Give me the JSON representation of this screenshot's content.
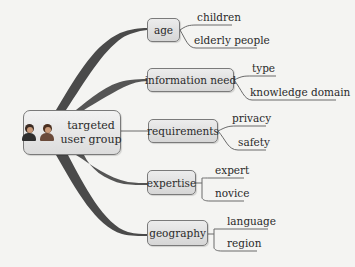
{
  "diagram": {
    "type": "mind-map",
    "center": {
      "label_line1": "targeted",
      "label_line2": "user group",
      "icon": "people-icon",
      "box": {
        "x": 23,
        "y": 110,
        "w": 98,
        "h": 45
      }
    },
    "branches": [
      {
        "label": "age",
        "box": {
          "x": 147,
          "y": 18,
          "w": 33,
          "h": 24
        },
        "children": [
          {
            "label": "children",
            "x": 197,
            "y": 13,
            "line_end": 232
          },
          {
            "label": "elderly people",
            "x": 194,
            "y": 36,
            "line_end": 257
          }
        ]
      },
      {
        "label": "information need",
        "box": {
          "x": 147,
          "y": 68,
          "w": 87,
          "h": 24
        },
        "children": [
          {
            "label": "type",
            "x": 252,
            "y": 64,
            "line_end": 276
          },
          {
            "label": "knowledge domain",
            "x": 250,
            "y": 88,
            "line_end": 336
          }
        ]
      },
      {
        "label": "requirements",
        "box": {
          "x": 148,
          "y": 119,
          "w": 70,
          "h": 24
        },
        "children": [
          {
            "label": "privacy",
            "x": 232,
            "y": 114,
            "line_end": 266
          },
          {
            "label": "safety",
            "x": 238,
            "y": 138,
            "line_end": 266
          }
        ]
      },
      {
        "label": "expertise",
        "box": {
          "x": 147,
          "y": 170,
          "w": 49,
          "h": 25
        },
        "children": [
          {
            "label": "expert",
            "x": 215,
            "y": 166,
            "line_end": 244
          },
          {
            "label": "novice",
            "x": 215,
            "y": 189,
            "line_end": 244
          }
        ]
      },
      {
        "label": "geography",
        "box": {
          "x": 147,
          "y": 220,
          "w": 61,
          "h": 26
        },
        "children": [
          {
            "label": "language",
            "x": 227,
            "y": 215,
            "line_end": 268
          },
          {
            "label": "region",
            "x": 227,
            "y": 238,
            "line_end": 257
          }
        ]
      }
    ],
    "colors": {
      "branch_fill": "#4a4a4a",
      "node_border": "#7a7a7a",
      "leaf_line": "#6a6a6a",
      "background": "#f4f4f2"
    }
  }
}
